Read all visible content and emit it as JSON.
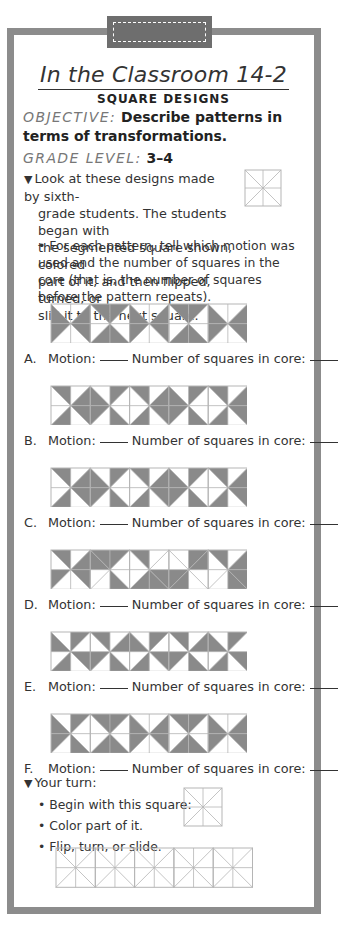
{
  "header": {
    "title": "In the Classroom 14-2",
    "subtitle": "SQUARE DESIGNS"
  },
  "objective": {
    "label": "OBJECTIVE:",
    "text": "Describe patterns in terms of transformations."
  },
  "grade": {
    "label": "GRADE LEVEL:",
    "value": "3–4"
  },
  "intro": {
    "marker": "▼",
    "line1": "Look at these designs made by sixth-",
    "line2": "grade students. The students began with",
    "line3": "the segmented square shown, colored",
    "line4": "part of it, and then flipped, turned, or",
    "line5": "slid it to the next square.",
    "bullet": "• For each pattern, tell which motion was used and the number of squares in the core (that is, the number of squares before the pattern repeats)."
  },
  "colors": {
    "frame": "#8c8c8c",
    "tab": "#6e6e6e",
    "shade": "#8a8a8a",
    "grid": "#b5b5b5"
  },
  "question_labels": {
    "motion": "Motion:",
    "core": "Number of squares in core:"
  },
  "patterns": [
    {
      "letter": "A.",
      "squares": [
        [
          "LT",
          "LB",
          "RT",
          "RB"
        ],
        [
          "TL",
          "TR",
          "BL",
          "BR"
        ],
        [
          "LT",
          "LB",
          "RT",
          "RB"
        ],
        [
          "TL",
          "TR",
          "BL",
          "BR"
        ],
        [
          "LT",
          "LB",
          "RT",
          "RB"
        ]
      ]
    },
    {
      "letter": "B.",
      "squares": [
        [
          "TL",
          "BL",
          "RT",
          "RB"
        ],
        [
          "LT",
          "LB",
          "TR",
          "BR"
        ],
        [
          "TL",
          "BL",
          "RT",
          "RB"
        ],
        [
          "LT",
          "LB",
          "TR",
          "BR"
        ],
        [
          "TL",
          "BL",
          "RT",
          "RB"
        ]
      ]
    },
    {
      "letter": "C.",
      "squares": [
        [
          "TL",
          "RT",
          "RB",
          "BL"
        ],
        [
          "TR",
          "LT",
          "LB",
          "BR"
        ],
        [
          "TL",
          "RT",
          "RB",
          "BL"
        ],
        [
          "TR",
          "LT",
          "LB",
          "BR"
        ],
        [
          "TL",
          "RT",
          "RB",
          "BL"
        ]
      ]
    },
    {
      "letter": "D.",
      "squares": [
        [
          "TL",
          "LB",
          "RT",
          "RB"
        ],
        [
          "TR",
          "TL",
          "BR",
          "LT"
        ],
        [
          "BL",
          "BR",
          "TL",
          "RB"
        ],
        [
          "TR",
          "LB",
          "BL",
          "RT"
        ],
        [
          "TL",
          "BR",
          "RT",
          "RB"
        ]
      ]
    },
    {
      "letter": "E.",
      "squares": [
        [
          "LT",
          "TR",
          "RB",
          "BL"
        ],
        [
          "TL",
          "RT",
          "BR",
          "LB"
        ],
        [
          "LT",
          "TR",
          "RB",
          "BL"
        ],
        [
          "TL",
          "RT",
          "BR",
          "LB"
        ],
        [
          "LT",
          "TR",
          "RB",
          "BL"
        ]
      ]
    },
    {
      "letter": "F.",
      "squares": [
        [
          "LT",
          "LB",
          "TR",
          "BR"
        ],
        [
          "TL",
          "TR",
          "BL",
          "BR"
        ],
        [
          "LT",
          "LB",
          "RT",
          "RB"
        ],
        [
          "TL",
          "TR",
          "BL",
          "BR"
        ],
        [
          "LT",
          "LB",
          "RT",
          "RB"
        ]
      ]
    }
  ],
  "your_turn": {
    "marker": "▼",
    "title": "Your turn:",
    "steps": [
      "• Begin with this square:",
      "• Color part of it.",
      "• Flip, turn, or slide."
    ],
    "blank_squares": 5
  }
}
